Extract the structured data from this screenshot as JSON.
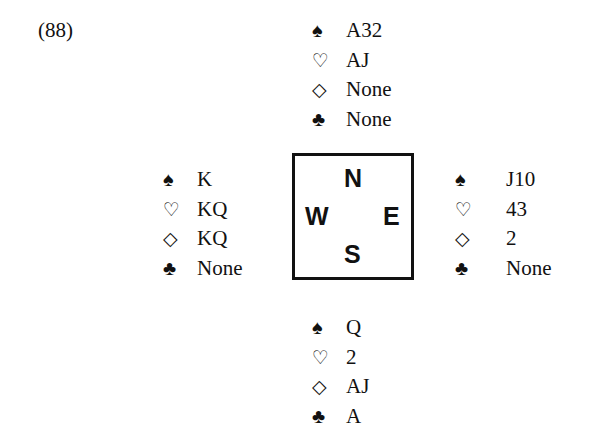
{
  "problem_number": "(88)",
  "compass": {
    "north": "N",
    "south": "S",
    "east": "E",
    "west": "W"
  },
  "hands": {
    "north": [
      {
        "suit": "spades",
        "symbol": "♠",
        "cards": "A32"
      },
      {
        "suit": "hearts",
        "symbol": "♡",
        "cards": "AJ"
      },
      {
        "suit": "diamonds",
        "symbol": "◇",
        "cards": "None"
      },
      {
        "suit": "clubs",
        "symbol": "♣",
        "cards": "None"
      }
    ],
    "west": [
      {
        "suit": "spades",
        "symbol": "♠",
        "cards": "K"
      },
      {
        "suit": "hearts",
        "symbol": "♡",
        "cards": "KQ"
      },
      {
        "suit": "diamonds",
        "symbol": "◇",
        "cards": "KQ"
      },
      {
        "suit": "clubs",
        "symbol": "♣",
        "cards": "None"
      }
    ],
    "east": [
      {
        "suit": "spades",
        "symbol": "♠",
        "cards": "J10"
      },
      {
        "suit": "hearts",
        "symbol": "♡",
        "cards": "43"
      },
      {
        "suit": "diamonds",
        "symbol": "◇",
        "cards": "2"
      },
      {
        "suit": "clubs",
        "symbol": "♣",
        "cards": "None"
      }
    ],
    "south": [
      {
        "suit": "spades",
        "symbol": "♠",
        "cards": "Q"
      },
      {
        "suit": "hearts",
        "symbol": "♡",
        "cards": "2"
      },
      {
        "suit": "diamonds",
        "symbol": "◇",
        "cards": "AJ"
      },
      {
        "suit": "clubs",
        "symbol": "♣",
        "cards": "A"
      }
    ]
  }
}
